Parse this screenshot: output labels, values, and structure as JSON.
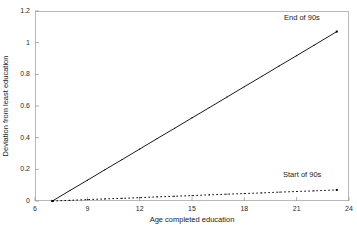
{
  "chart_data": {
    "type": "line",
    "title": "",
    "xlabel": "Age completed education",
    "ylabel": "Deviation from least education",
    "xlim": [
      6,
      24
    ],
    "ylim": [
      0,
      1.2
    ],
    "xticks": [
      6,
      9,
      12,
      15,
      18,
      21,
      24
    ],
    "xtick_labels": [
      "6",
      "9",
      "12",
      "15",
      "18",
      "21",
      "24"
    ],
    "yticks": [
      0,
      0.2,
      0.4,
      0.6,
      0.8,
      1,
      1.2
    ],
    "ytick_labels": [
      "0",
      "0.2",
      "0.4",
      "0.6",
      "0.8",
      "1",
      "1.2"
    ],
    "grid": false,
    "legend_position": "inline-annotations",
    "series": [
      {
        "name": "End of 90s",
        "style": "solid",
        "color": "#000000",
        "marker": "square",
        "x": [
          7,
          8,
          9,
          10,
          11,
          12,
          13,
          14,
          15,
          16,
          17,
          18,
          19,
          20,
          21,
          22,
          23.3
        ],
        "values": [
          0,
          0.066,
          0.131,
          0.197,
          0.262,
          0.328,
          0.394,
          0.459,
          0.525,
          0.59,
          0.656,
          0.722,
          0.787,
          0.853,
          0.918,
          0.984,
          1.07
        ]
      },
      {
        "name": "Start of 90s",
        "style": "dotted",
        "color": "#000000",
        "marker": "square",
        "x": [
          7,
          8,
          9,
          10,
          11,
          12,
          13,
          14,
          15,
          16,
          17,
          18,
          19,
          20,
          21,
          22,
          23.3
        ],
        "values": [
          0,
          0.004,
          0.009,
          0.013,
          0.017,
          0.021,
          0.026,
          0.03,
          0.034,
          0.039,
          0.043,
          0.047,
          0.051,
          0.056,
          0.06,
          0.064,
          0.07
        ]
      }
    ],
    "annotations": [
      {
        "text": "End of 90s",
        "series": "End of 90s"
      },
      {
        "text": "Start of 90s",
        "series": "Start of 90s"
      }
    ]
  }
}
